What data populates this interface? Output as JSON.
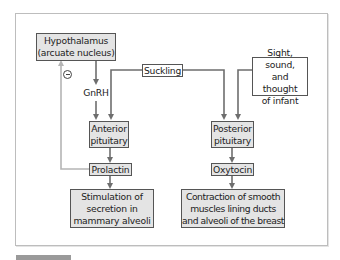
{
  "diagram": {
    "nodes": {
      "hypothalamus": "Hypothalamus\n(arcuate nucleus)",
      "suckling": "Suckling",
      "sight": "Sight, sound,\nand thought\nof infant",
      "anterior_pituitary": "Anterior\npituitary",
      "posterior_pituitary": "Posterior\npituitary",
      "prolactin": "Prolactin",
      "oxytocin": "Oxytocin",
      "stimulation": "Stimulation of\nsecretion in\nmammary alveoli",
      "contraction": "Contraction of smooth\nmuscles lining ducts\nand alveoli of the breast"
    },
    "edge_labels": {
      "gnrh": "GnRH",
      "inhibition_symbol": "minus"
    },
    "edges": [
      {
        "from": "hypothalamus",
        "to": "anterior_pituitary",
        "label": "GnRH"
      },
      {
        "from": "suckling",
        "to": "anterior_pituitary"
      },
      {
        "from": "suckling",
        "to": "posterior_pituitary"
      },
      {
        "from": "sight",
        "to": "posterior_pituitary"
      },
      {
        "from": "anterior_pituitary",
        "to": "prolactin"
      },
      {
        "from": "prolactin",
        "to": "stimulation"
      },
      {
        "from": "prolactin",
        "to": "hypothalamus",
        "type": "negative-feedback"
      },
      {
        "from": "posterior_pituitary",
        "to": "oxytocin"
      },
      {
        "from": "oxytocin",
        "to": "contraction"
      }
    ],
    "colors": {
      "box_fill": "#e4e4e4",
      "box_border": "#555555",
      "arrow": "#6e6e6e",
      "feedback_arrow": "#b5b5b5",
      "frame_border": "#bdbdbd"
    }
  }
}
